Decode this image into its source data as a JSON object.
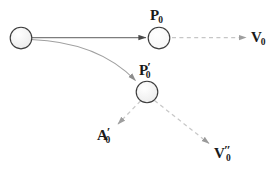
{
  "diagram": {
    "type": "vector-kinematics-diagram",
    "background_color": "#ffffff",
    "nodes": [
      {
        "id": "origin-node",
        "name": "origin-node",
        "label": "",
        "cx": 21,
        "cy": 38,
        "r": 11,
        "fill": "#f2f2f2",
        "stroke": "#3a3a3a"
      },
      {
        "id": "p0-node",
        "name": "p0-node",
        "label": "P0",
        "cx": 159,
        "cy": 38,
        "r": 11,
        "fill": "#ffffff",
        "stroke": "#3a3a3a"
      },
      {
        "id": "p0prime-node",
        "name": "p0prime-node",
        "label": "P'0",
        "cx": 147,
        "cy": 92,
        "r": 11,
        "fill": "#f0f0f0",
        "stroke": "#3a3a3a"
      }
    ],
    "labels": {
      "p0": {
        "base": "P",
        "prime": "",
        "sub": "0"
      },
      "v0": {
        "base": "V",
        "prime": "",
        "sub": "0"
      },
      "p0prime": {
        "base": "P",
        "prime": "′",
        "sub": "0"
      },
      "a0prime": {
        "base": "A",
        "prime": "′",
        "sub": "0"
      },
      "v0prime": {
        "base": "V",
        "prime": "″",
        "sub": "0"
      }
    },
    "arrows": [
      {
        "id": "position-arrow",
        "name": "position-arrow-to-p0",
        "style": "solid",
        "color": "#7a7a7a",
        "head_color": "#4a4a4a",
        "from": [
          32,
          38
        ],
        "to": [
          147,
          38
        ]
      },
      {
        "id": "curved-arrow",
        "name": "curved-displacement-arrow",
        "style": "solid-curve",
        "color": "#9a9a9a",
        "head_color": "#8c8c8c",
        "from": [
          31,
          39
        ],
        "control": [
          100,
          44
        ],
        "to": [
          137,
          83
        ]
      },
      {
        "id": "v0-arrow",
        "name": "velocity-v0-arrow",
        "style": "dashed",
        "color": "#c2c2c2",
        "head_color": "#9e9e9e",
        "from": [
          171,
          38
        ],
        "to": [
          248,
          38
        ]
      },
      {
        "id": "a0prime-arrow",
        "name": "acceleration-a0prime-arrow",
        "style": "dashed",
        "color": "#c6c6c6",
        "head_color": "#a0a0a0",
        "from": [
          139,
          101
        ],
        "to": [
          117,
          125
        ]
      },
      {
        "id": "v0prime-arrow",
        "name": "velocity-v0prime-arrow",
        "style": "dashed",
        "color": "#c6c6c6",
        "head_color": "#9a9a9a",
        "from": [
          155,
          101
        ],
        "to": [
          211,
          145
        ]
      }
    ]
  }
}
